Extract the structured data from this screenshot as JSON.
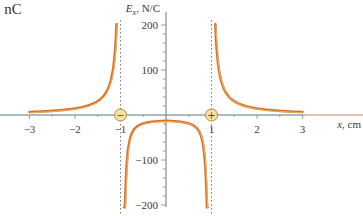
{
  "corner_text": "1 nC",
  "chart_data": {
    "type": "line",
    "title": "",
    "xlabel": "x, cm",
    "ylabel": "Ex, N/C",
    "ylabel_main": "E",
    "ylabel_sub": "x",
    "ylabel_units": ", N/C",
    "xlim": [
      -3,
      3
    ],
    "ylim": [
      -200,
      200
    ],
    "x_ticks": [
      -3,
      -2,
      -1,
      1,
      2,
      3
    ],
    "x_tick_labels": [
      "−3",
      "−2",
      "−1",
      "1",
      "2",
      "3"
    ],
    "y_ticks": [
      200,
      100,
      -100,
      -200
    ],
    "y_tick_labels": [
      "200",
      "100",
      "−100",
      "−200"
    ],
    "grid": false,
    "asymptotes": [
      -1,
      1
    ],
    "charges": [
      {
        "x": -1,
        "sign": "−",
        "name": "negative-charge"
      },
      {
        "x": 1,
        "sign": "+",
        "name": "positive-charge"
      }
    ],
    "series": [
      {
        "name": "left-branch",
        "x": [
          -3,
          -2.5,
          -2,
          -1.75,
          -1.5,
          -1.35,
          -1.25,
          -1.15,
          -1.1
        ],
        "values": [
          7,
          10,
          16,
          22,
          33,
          50,
          75,
          140,
          200
        ]
      },
      {
        "name": "middle-branch",
        "x": [
          -0.9,
          -0.85,
          -0.75,
          -0.6,
          -0.4,
          -0.2,
          0,
          0.2,
          0.4,
          0.6,
          0.75,
          0.85,
          0.9
        ],
        "values": [
          -200,
          -130,
          -60,
          -32,
          -20,
          -15,
          -13,
          -15,
          -20,
          -32,
          -60,
          -130,
          -200
        ]
      },
      {
        "name": "right-branch",
        "x": [
          1.1,
          1.15,
          1.25,
          1.35,
          1.5,
          1.75,
          2,
          2.5,
          3
        ],
        "values": [
          200,
          140,
          75,
          50,
          33,
          22,
          16,
          10,
          7
        ]
      }
    ],
    "colors": {
      "curve": "#d9702a",
      "curve_highlight": "#f5d77a",
      "axis": "#5a7d84",
      "axis_arrow": "#e7a9a0",
      "charge_fill": "#f4e3a3",
      "charge_border": "#b98a3a",
      "asymptote": "#7a7a7a"
    }
  }
}
